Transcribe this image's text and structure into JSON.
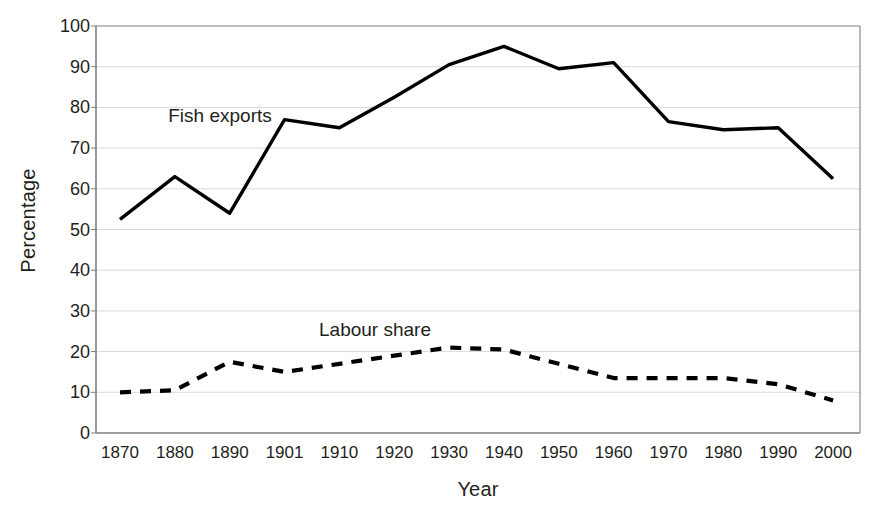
{
  "chart_data": {
    "type": "line",
    "title": "",
    "xlabel": "Year",
    "ylabel": "Percentage",
    "categories": [
      "1870",
      "1880",
      "1890",
      "1901",
      "1910",
      "1920",
      "1930",
      "1940",
      "1950",
      "1960",
      "1970",
      "1980",
      "1990",
      "2000"
    ],
    "yticks": [
      "0",
      "10",
      "20",
      "30",
      "40",
      "50",
      "60",
      "70",
      "80",
      "90",
      "100"
    ],
    "ylim": [
      0,
      100
    ],
    "grid": "horizontal",
    "legend": "inline-annotations",
    "series": [
      {
        "name": "Fish exports",
        "style": "solid",
        "color": "#000000",
        "values": [
          52.5,
          63,
          54,
          77,
          75,
          82.5,
          90.5,
          95,
          89.5,
          91,
          76.5,
          74.5,
          75,
          62.5
        ]
      },
      {
        "name": "Labour share",
        "style": "dashed",
        "color": "#000000",
        "values": [
          10,
          10.5,
          17.5,
          15,
          17,
          19,
          21,
          20.5,
          17,
          13.5,
          13.5,
          13.5,
          12,
          8
        ]
      }
    ],
    "annotations": [
      {
        "text": "Fish exports",
        "x": 220,
        "y": 116
      },
      {
        "text": "Labour share",
        "x": 375,
        "y": 330
      }
    ],
    "colors": {
      "axis": "#7f7f7f",
      "grid": "#d9d9d9",
      "text": "#231f20",
      "background": "#ffffff"
    }
  },
  "geometry": {
    "plot_left": 96,
    "plot_right": 860,
    "plot_top": 26,
    "plot_bottom": 433,
    "x_first": 120,
    "x_step": 54.85
  }
}
